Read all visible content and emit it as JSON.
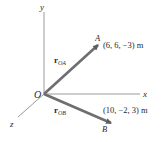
{
  "diagram": {
    "type": "3d-position-vectors",
    "axes": {
      "x_label": "x",
      "y_label": "y",
      "z_label": "z",
      "origin_label": "O"
    },
    "points": [
      {
        "name": "A",
        "coords_label": "(6, 6, −3) m"
      },
      {
        "name": "B",
        "coords_label": "(10, −2, 3) m"
      }
    ],
    "vectors": [
      {
        "symbol": "r",
        "subscript": "OA",
        "from": "O",
        "to": "A"
      },
      {
        "symbol": "r",
        "subscript": "OB",
        "from": "O",
        "to": "B"
      }
    ],
    "colors": {
      "axis": "#8c8c8c",
      "vector": "#6e6e6e",
      "text": "#2a2a2a",
      "background": "#ffffff"
    }
  }
}
